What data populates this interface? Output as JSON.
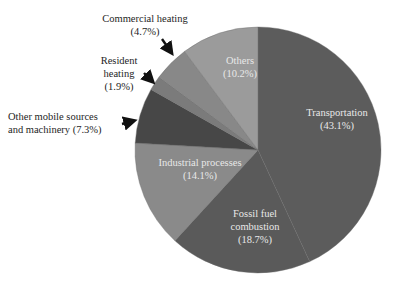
{
  "chart_data": {
    "type": "pie",
    "title": "",
    "start_angle_deg": 0,
    "direction": "clockwise",
    "slices": [
      {
        "name": "Transportation",
        "value": 43.1,
        "label_lines": [
          "Transportation",
          "(43.1%)"
        ],
        "color": "#5c5c5c",
        "label_style": "inside"
      },
      {
        "name": "Fossil fuel combustion",
        "value": 18.7,
        "label_lines": [
          "Fossil fuel",
          "combustion",
          "(18.7%)"
        ],
        "color": "#5a5a5a",
        "label_style": "inside"
      },
      {
        "name": "Industrial processes",
        "value": 14.1,
        "label_lines": [
          "Industrial processes",
          "(14.1%)"
        ],
        "color": "#8a8a8a",
        "label_style": "inside"
      },
      {
        "name": "Other mobile sources and machinery",
        "value": 7.3,
        "label_lines": [
          "Other mobile sources",
          "and machinery (7.3%)"
        ],
        "color": "#474747",
        "label_style": "outside-arrow"
      },
      {
        "name": "Resident heating",
        "value": 1.9,
        "label_lines": [
          "Resident",
          "heating",
          "(1.9%)"
        ],
        "color": "#7b7b7b",
        "label_style": "outside-arrow"
      },
      {
        "name": "Commercial heating",
        "value": 4.7,
        "label_lines": [
          "Commercial heating",
          "(4.7%)"
        ],
        "color": "#888888",
        "label_style": "outside-arrow"
      },
      {
        "name": "Others",
        "value": 10.2,
        "label_lines": [
          "Others",
          "(10.2%)"
        ],
        "color": "#9b9b9b",
        "label_style": "inside"
      }
    ]
  },
  "labels": {
    "transportation": {
      "line1": "Transportation",
      "line2": "(43.1%)"
    },
    "fossil": {
      "line1": "Fossil fuel",
      "line2": "combustion",
      "line3": "(18.7%)"
    },
    "industrial": {
      "line1": "Industrial processes",
      "line2": "(14.1%)"
    },
    "other_mobile": {
      "line1": "Other mobile sources",
      "line2": "and machinery (7.3%)"
    },
    "resident": {
      "line1": "Resident",
      "line2": "heating",
      "line3": "(1.9%)"
    },
    "commercial": {
      "line1": "Commercial heating",
      "line2": "(4.7%)"
    },
    "others": {
      "line1": "Others",
      "line2": "(10.2%)"
    }
  }
}
